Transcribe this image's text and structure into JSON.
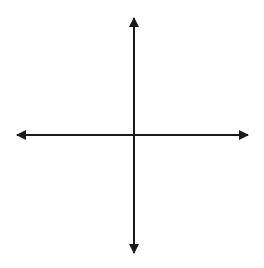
{
  "top_text": "",
  "chart_data": {
    "type": "vector-diagram",
    "title": "",
    "xlabel": "x",
    "ylabel": "y",
    "grid": true,
    "xlim": [
      -10,
      10
    ],
    "ylim": [
      -10,
      10
    ],
    "vectors": [
      {
        "name": "resultant",
        "color": "#1a1a1a",
        "from": [
          0,
          0
        ],
        "to": [
          7,
          5
        ]
      },
      {
        "name": "vector-a",
        "color": "#808080",
        "from": [
          0,
          0
        ],
        "to": [
          5,
          2
        ]
      },
      {
        "name": "vector-b",
        "color": "#808080",
        "from": [
          5,
          2
        ],
        "to": [
          7,
          5
        ]
      }
    ]
  },
  "colors": {
    "grid": "#c8c8c8",
    "axis": "#1a1a1a",
    "black_vector": "#1a1a1a",
    "gray_vector": "#808080"
  }
}
